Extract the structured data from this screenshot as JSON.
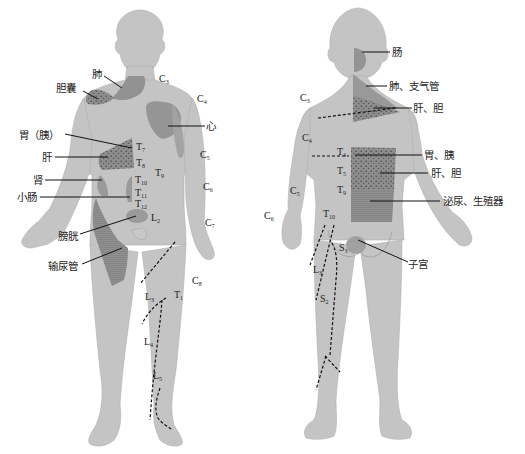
{
  "figure": {
    "title": "",
    "colors": {
      "body": "#c4c4c4",
      "body_outline": "#aaaaaa",
      "organ_zone": "#959595",
      "organ_zone_dark": "#8a8a8a",
      "stipple": "#555555",
      "leader_line": "#111111",
      "text": "#222222",
      "background": "#ffffff"
    },
    "front_view": {
      "organ_labels": [
        {
          "id": "lung",
          "text": "肺"
        },
        {
          "id": "gallbladder",
          "text": "胆囊"
        },
        {
          "id": "heart",
          "text": "心"
        },
        {
          "id": "stomach_pancreas",
          "text": "胃（胰）"
        },
        {
          "id": "liver",
          "text": "肝"
        },
        {
          "id": "kidney",
          "text": "肾"
        },
        {
          "id": "small_intestine",
          "text": "小肠"
        },
        {
          "id": "bladder",
          "text": "膀胱"
        },
        {
          "id": "ureter",
          "text": "输尿管"
        }
      ],
      "segment_labels": [
        {
          "base": "C",
          "sub": "3"
        },
        {
          "base": "C",
          "sub": "4"
        },
        {
          "base": "C",
          "sub": "5"
        },
        {
          "base": "C",
          "sub": "6"
        },
        {
          "base": "C",
          "sub": "7"
        },
        {
          "base": "C",
          "sub": "8"
        },
        {
          "base": "T",
          "sub": "7"
        },
        {
          "base": "T",
          "sub": "8"
        },
        {
          "base": "T",
          "sub": "9"
        },
        {
          "base": "T",
          "sub": "10"
        },
        {
          "base": "T",
          "sub": "11"
        },
        {
          "base": "T",
          "sub": "12"
        },
        {
          "base": "T",
          "sub": "1"
        },
        {
          "base": "L",
          "sub": "2"
        },
        {
          "base": "L",
          "sub": "3"
        },
        {
          "base": "L",
          "sub": "4"
        },
        {
          "base": "L",
          "sub": "5"
        }
      ]
    },
    "back_view": {
      "organ_labels": [
        {
          "id": "intestine",
          "text": "肠"
        },
        {
          "id": "lung_bronchus",
          "text": "肺、支气管"
        },
        {
          "id": "liver_gallbladder_upper",
          "text": "肝、胆"
        },
        {
          "id": "stomach_pancreas",
          "text": "胃、胰"
        },
        {
          "id": "liver_gallbladder_lower",
          "text": "肝、胆"
        },
        {
          "id": "urogenital",
          "text": "泌尿、生殖器"
        },
        {
          "id": "uterus",
          "text": "子宫"
        }
      ],
      "segment_labels": [
        {
          "base": "C",
          "sub": "3"
        },
        {
          "base": "C",
          "sub": "4"
        },
        {
          "base": "C",
          "sub": "5"
        },
        {
          "base": "C",
          "sub": "6"
        },
        {
          "base": "T",
          "sub": "4"
        },
        {
          "base": "T",
          "sub": "5"
        },
        {
          "base": "T",
          "sub": "9"
        },
        {
          "base": "T",
          "sub": "10"
        },
        {
          "base": "L",
          "sub": "3"
        },
        {
          "base": "S",
          "sub": "3"
        },
        {
          "base": "S",
          "sub": "2"
        }
      ]
    }
  }
}
